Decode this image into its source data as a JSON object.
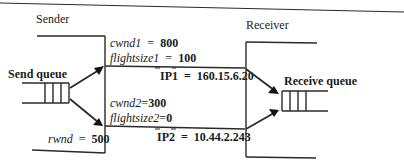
{
  "sender": {
    "title": "Sender",
    "send_queue_label": "Send queue",
    "rwnd_label": "rwnd",
    "rwnd_value": "500"
  },
  "receiver": {
    "title": "Receiver",
    "receive_queue_label": "Receive queue"
  },
  "path1": {
    "cwnd_label": "cwnd1",
    "cwnd_value": "800",
    "flightsize_label": "flightsize1",
    "flightsize_value": "100",
    "ip_label": "IP1",
    "ip_value": "160.15.6.20"
  },
  "path2": {
    "cwnd_label": "cwnd2",
    "cwnd_value": "300",
    "flightsize_label": "flightsize2",
    "flightsize_value": "0",
    "ip_label": "IP2",
    "ip_value": "10.44.2.243"
  },
  "symbols": {
    "equals": "="
  }
}
